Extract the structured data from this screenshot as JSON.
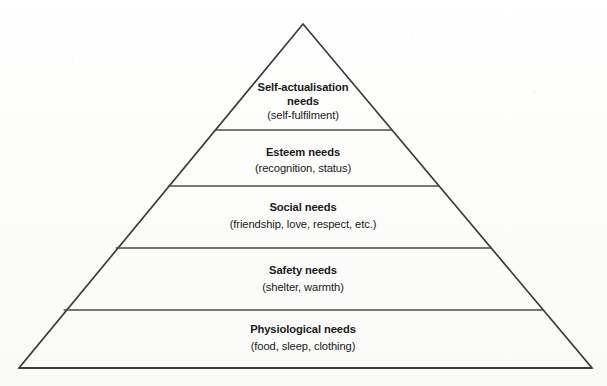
{
  "diagram": {
    "name": "maslow-hierarchy-of-needs-pyramid",
    "type": "pyramid",
    "shape_color": "#3c3c3c",
    "text_color": "#1a1a1a",
    "background_color": "#fdfdfc",
    "apex": {
      "x": 303,
      "y": 24
    },
    "base_left": {
      "x": 19,
      "y": 368
    },
    "base_right": {
      "x": 592,
      "y": 368
    },
    "divider_y": [
      130,
      186,
      248,
      310
    ]
  },
  "tiers": [
    {
      "level": 5,
      "title": "Self-actualisation",
      "title_line2": "needs",
      "subtitle": "(self-fulfilment)",
      "title_y": 91,
      "title_line2_y": 105,
      "subtitle_y": 119,
      "center_x": 303
    },
    {
      "level": 4,
      "title": "Esteem needs",
      "title_line2": "",
      "subtitle": "(recognition, status)",
      "title_y": 156,
      "title_line2_y": 0,
      "subtitle_y": 172,
      "center_x": 303
    },
    {
      "level": 3,
      "title": "Social needs",
      "title_line2": "",
      "subtitle": "(friendship, love, respect, etc.)",
      "title_y": 211,
      "title_line2_y": 0,
      "subtitle_y": 228,
      "center_x": 303
    },
    {
      "level": 2,
      "title": "Safety needs",
      "title_line2": "",
      "subtitle": "(shelter, warmth)",
      "title_y": 274,
      "title_line2_y": 0,
      "subtitle_y": 291,
      "center_x": 303
    },
    {
      "level": 1,
      "title": "Physiological needs",
      "title_line2": "",
      "subtitle": "(food, sleep, clothing)",
      "title_y": 333,
      "title_line2_y": 0,
      "subtitle_y": 350,
      "center_x": 303
    }
  ]
}
